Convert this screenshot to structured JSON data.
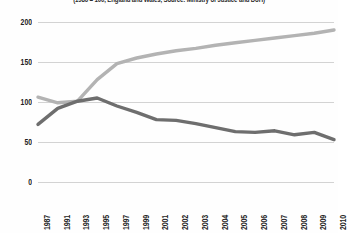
{
  "chart_data": {
    "type": "line",
    "title": "(1986 = 100, England and Wales, Source: Ministry of Justice and DoH)",
    "xlabel": "",
    "ylabel": "",
    "ylim": [
      0,
      200
    ],
    "yticks": [
      0,
      50,
      100,
      150,
      200
    ],
    "grid": true,
    "legend": "none",
    "x": [
      "1987",
      "1991",
      "1993",
      "1995",
      "1997",
      "1999",
      "2001",
      "2002",
      "2003",
      "2004",
      "2005",
      "2006",
      "2007",
      "2008",
      "2009",
      "2010"
    ],
    "categories": [
      "1987",
      "1991",
      "1993",
      "1995",
      "1997",
      "1999",
      "2001",
      "2002",
      "2003",
      "2004",
      "2005",
      "2006",
      "2007",
      "2008",
      "2009",
      "2010"
    ],
    "series": [
      {
        "name": "rising-series",
        "color": "#b3b3b3",
        "values": [
          106,
          99,
          101,
          128,
          148,
          155,
          160,
          164,
          167,
          171,
          174,
          177,
          180,
          183,
          186,
          190
        ]
      },
      {
        "name": "falling-series",
        "color": "#6e6e6e",
        "values": [
          72,
          92,
          101,
          105,
          95,
          87,
          78,
          77,
          73,
          68,
          63,
          62,
          64,
          59,
          62,
          53
        ]
      }
    ]
  },
  "yaxis": {
    "ticks": [
      {
        "label": "200",
        "value": 200
      },
      {
        "label": "150",
        "value": 150
      },
      {
        "label": "100",
        "value": 100
      },
      {
        "label": "50",
        "value": 50
      },
      {
        "label": "0",
        "value": 0
      }
    ]
  },
  "colors": {
    "series_light": "#b3b3b3",
    "series_dark": "#6e6e6e",
    "gridline": "#d3d3d3",
    "text": "#222222",
    "background": "#fefefe"
  }
}
